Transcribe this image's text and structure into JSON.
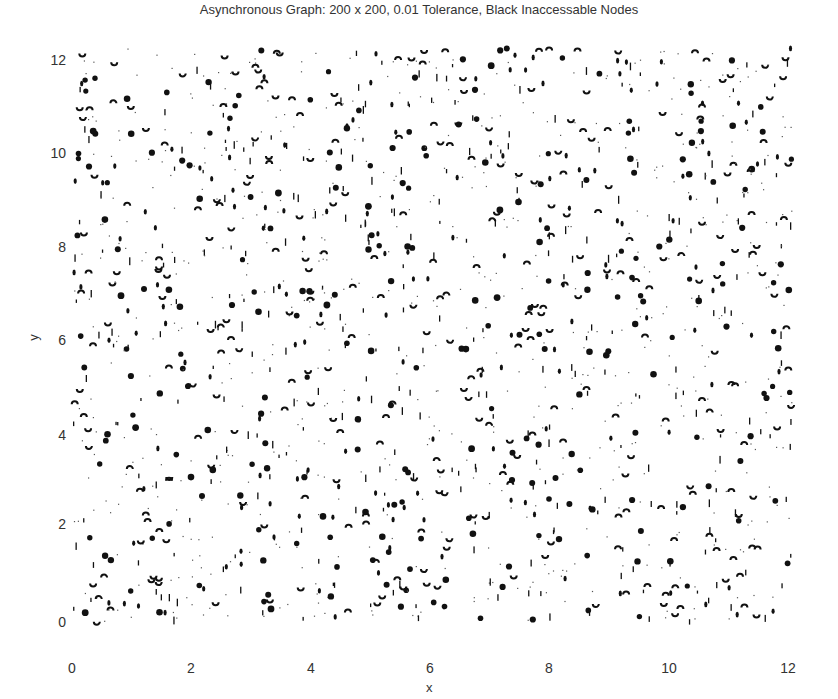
{
  "chart_data": {
    "type": "scatter",
    "title": "Asynchronous Graph: 200 x 200, 0.01 Tolerance, Black Inaccessable Nodes",
    "xlabel": "x",
    "ylabel": "y",
    "xlim": [
      0,
      12
    ],
    "ylim": [
      0,
      12
    ],
    "x_ticks": [
      "0",
      "2",
      "4",
      "6",
      "8",
      "10",
      "12"
    ],
    "y_ticks": [
      "0",
      "2",
      "4",
      "6",
      "8",
      "10",
      "12"
    ],
    "grid": false,
    "axes_box": false,
    "legend": null,
    "marker_color": "#111111",
    "marker_types": [
      "filled-dot",
      "half-arc-up",
      "half-arc-down",
      "vertical-tick",
      "small-dot"
    ],
    "approx_marker_count": 1600
  }
}
